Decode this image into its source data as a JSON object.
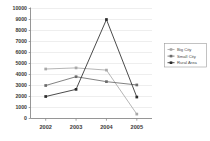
{
  "chart_data": {
    "type": "line",
    "title": "",
    "xlabel": "",
    "ylabel": "",
    "categories": [
      "2002",
      "2003",
      "2004",
      "2005"
    ],
    "ylim": [
      0,
      10000
    ],
    "ytick_labels": [
      "0",
      "1000",
      "2000",
      "3000",
      "4000",
      "5000",
      "6000",
      "7000",
      "8000",
      "9000",
      "10000"
    ],
    "ytick_values": [
      0,
      1000,
      2000,
      3000,
      4000,
      5000,
      6000,
      7000,
      8000,
      9000,
      10000
    ],
    "grid": true,
    "legend_position": "right",
    "series": [
      {
        "name": "Big City",
        "values": [
          4500,
          4600,
          4400,
          400
        ],
        "color": "#a8a8a8",
        "marker": "square"
      },
      {
        "name": "Small City",
        "values": [
          3000,
          3800,
          3350,
          3050
        ],
        "color": "#6b6b6b",
        "marker": "square"
      },
      {
        "name": "Rural Area",
        "values": [
          2000,
          2650,
          9000,
          1950
        ],
        "color": "#2b2b2b",
        "marker": "square"
      }
    ]
  },
  "legend": {
    "entries": [
      "Big City",
      "Small City",
      "Rural Area"
    ]
  },
  "axis": {
    "y_max_label": "10000",
    "y_min_label": "0",
    "x_first": "2002",
    "x_last": "2005"
  }
}
